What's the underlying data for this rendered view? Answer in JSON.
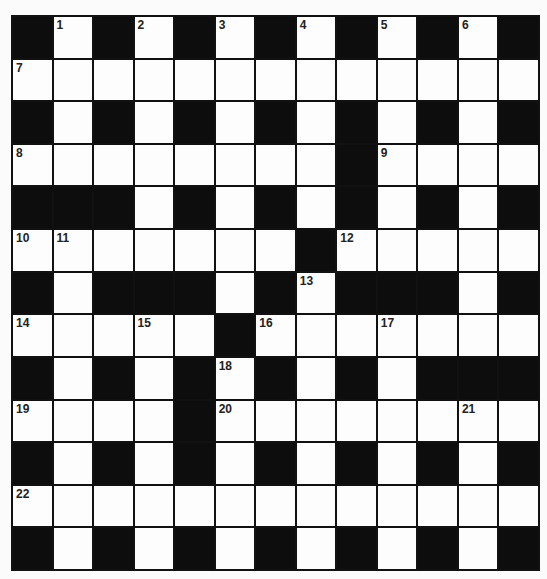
{
  "puzzle": {
    "rows": 13,
    "cols": 13,
    "layout": [
      "#1#2#3#4#5#6#",
      "7............",
      "#.#.#.#.#.#.#",
      "8.......#9...",
      "###.#.#.#.#.#",
      "AB.....#C....",
      "#.###.#D###.#",
      "E..F.#G..H...",
      "#.#.#I#.#.###",
      "J...#K.....L.",
      "#.#.#.#.#.#.#",
      "M............",
      "#.#.#.#.#.#.#"
    ],
    "numbers": {
      "0,1": "1",
      "0,3": "2",
      "0,5": "3",
      "0,7": "4",
      "0,9": "5",
      "0,11": "6",
      "1,0": "7",
      "3,0": "8",
      "3,9": "9",
      "5,0": "10",
      "5,1": "11",
      "5,8": "12",
      "6,7": "13",
      "7,0": "14",
      "7,3": "15",
      "7,6": "16",
      "7,9": "17",
      "8,5": "18",
      "9,0": "19",
      "9,5": "20",
      "9,11": "21",
      "11,0": "22"
    },
    "black_cells": [
      "0,0",
      "0,2",
      "0,4",
      "0,6",
      "0,8",
      "0,10",
      "0,12",
      "2,0",
      "2,2",
      "2,4",
      "2,6",
      "2,8",
      "2,10",
      "2,12",
      "3,8",
      "4,0",
      "4,1",
      "4,2",
      "4,4",
      "4,6",
      "4,8",
      "4,10",
      "4,12",
      "5,7",
      "6,0",
      "6,2",
      "6,3",
      "6,4",
      "6,6",
      "6,8",
      "6,9",
      "6,10",
      "6,12",
      "7,5",
      "8,0",
      "8,2",
      "8,4",
      "8,6",
      "8,8",
      "8,10",
      "8,11",
      "8,12",
      "9,4",
      "10,0",
      "10,2",
      "10,4",
      "10,6",
      "10,8",
      "10,10",
      "10,12",
      "12,0",
      "12,2",
      "12,4",
      "12,6",
      "12,8",
      "12,10",
      "12,12"
    ]
  }
}
